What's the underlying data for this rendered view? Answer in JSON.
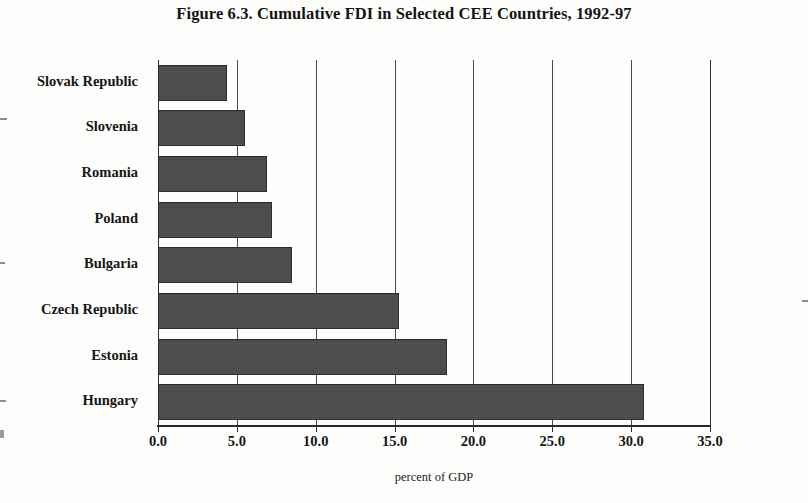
{
  "chart_data": {
    "type": "bar",
    "orientation": "horizontal",
    "title": "Figure 6.3.  Cumulative FDI in Selected CEE Countries, 1992-97",
    "xlabel": "percent of GDP",
    "ylabel": "",
    "xlim": [
      0,
      35
    ],
    "xticks": [
      "0.0",
      "5.0",
      "10.0",
      "15.0",
      "20.0",
      "25.0",
      "30.0",
      "35.0"
    ],
    "xtick_values": [
      0,
      5,
      10,
      15,
      20,
      25,
      30,
      35
    ],
    "grid": "vertical",
    "legend": "none",
    "bar_color": "#4a4a4a",
    "bar_edge_color": "#2c2c2c",
    "categories": [
      "Slovak Republic",
      "Slovenia",
      "Romania",
      "Poland",
      "Bulgaria",
      "Czech Republic",
      "Estonia",
      "Hungary"
    ],
    "values": [
      4.4,
      5.5,
      6.9,
      7.2,
      8.5,
      15.3,
      18.3,
      30.8
    ],
    "points": [
      {
        "category": "Slovak Republic",
        "value": 4.4
      },
      {
        "category": "Slovenia",
        "value": 5.5
      },
      {
        "category": "Romania",
        "value": 6.9
      },
      {
        "category": "Poland",
        "value": 7.2
      },
      {
        "category": "Bulgaria",
        "value": 8.5
      },
      {
        "category": "Czech Republic",
        "value": 15.3
      },
      {
        "category": "Estonia",
        "value": 18.3
      },
      {
        "category": "Hungary",
        "value": 30.8
      }
    ]
  }
}
